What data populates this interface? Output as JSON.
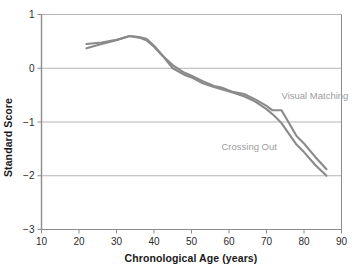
{
  "chart_data": {
    "type": "line",
    "title": "",
    "xlabel": "Chronological Age (years)",
    "ylabel": "Standard Score",
    "xlim": [
      10,
      90
    ],
    "ylim": [
      -3,
      1
    ],
    "xticks": [
      10,
      20,
      30,
      40,
      50,
      60,
      70,
      80,
      90
    ],
    "yticks": [
      1,
      0,
      -1,
      -2,
      -3
    ],
    "xtick_labels": [
      "10",
      "20",
      "30",
      "40",
      "50",
      "60",
      "70",
      "80",
      "90"
    ],
    "ytick_labels": [
      "1",
      "0",
      "−1",
      "−2",
      "−3"
    ],
    "grid": "horizontal",
    "gridlines_y": [
      1,
      0,
      -1,
      -2
    ],
    "legend": "inline-annotations",
    "line_color": "#8a8a8a",
    "label_color": "#9c9c9c",
    "axis_color": "#8c8c8c",
    "grid_color": "#b5b5b5",
    "series": [
      {
        "name": "Visual Matching",
        "label_position": {
          "x": 74,
          "y": -0.58
        },
        "x": [
          22,
          26,
          30,
          33.5,
          36,
          38,
          40,
          42,
          45,
          48,
          50,
          53,
          56,
          58,
          61,
          64,
          67,
          70,
          71.5,
          74,
          76,
          78,
          80,
          83,
          86
        ],
        "y": [
          0.45,
          0.48,
          0.53,
          0.6,
          0.57,
          0.52,
          0.4,
          0.25,
          0.06,
          -0.08,
          -0.14,
          -0.24,
          -0.33,
          -0.36,
          -0.44,
          -0.48,
          -0.58,
          -0.7,
          -0.78,
          -0.78,
          -1.02,
          -1.26,
          -1.4,
          -1.65,
          -1.88
        ]
      },
      {
        "name": "Crossing Out",
        "label_position": {
          "x": 58,
          "y": -1.53
        },
        "x": [
          22,
          26,
          30,
          33.5,
          36,
          38,
          40,
          42,
          45,
          48,
          50,
          53,
          56,
          58,
          61,
          64,
          67,
          70,
          72,
          74,
          76,
          78,
          80,
          83,
          86
        ],
        "y": [
          0.37,
          0.45,
          0.52,
          0.6,
          0.58,
          0.55,
          0.42,
          0.26,
          0.0,
          -0.12,
          -0.17,
          -0.28,
          -0.35,
          -0.39,
          -0.45,
          -0.52,
          -0.62,
          -0.76,
          -0.88,
          -1.02,
          -1.22,
          -1.42,
          -1.56,
          -1.8,
          -2.0
        ]
      }
    ]
  }
}
